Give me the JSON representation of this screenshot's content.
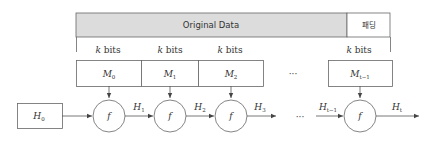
{
  "header": {
    "data_label": "Original Data",
    "padding_label": "패딩"
  },
  "block_size_labels": [
    "k bits",
    "k bits",
    "k bits",
    "k bits"
  ],
  "blocks": [
    {
      "name": "M",
      "sub": "0"
    },
    {
      "name": "M",
      "sub": "1"
    },
    {
      "name": "M",
      "sub": "2"
    },
    {
      "name": "M",
      "sub": "t−1"
    }
  ],
  "ellipsis": "···",
  "initial_hash": {
    "name": "H",
    "sub": "0"
  },
  "function_label": "f",
  "hash_outputs": [
    {
      "name": "H",
      "sub": "1"
    },
    {
      "name": "H",
      "sub": "2"
    },
    {
      "name": "H",
      "sub": "3"
    },
    {
      "name": "H",
      "sub": "t−1"
    },
    {
      "name": "H",
      "sub": "t"
    }
  ],
  "colors": {
    "header_fill": "#dcdcdc",
    "stroke": "#555555"
  }
}
